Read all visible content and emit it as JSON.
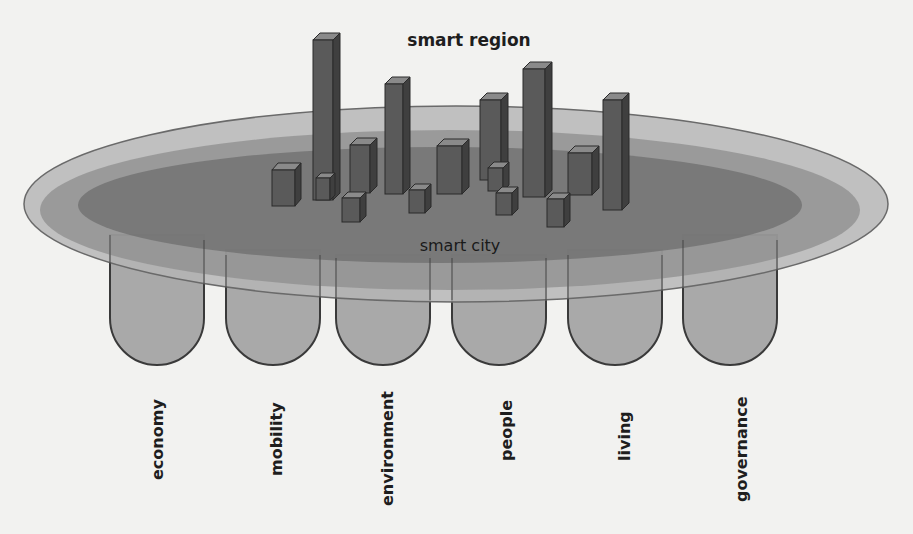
{
  "diagram": {
    "title_top": "smart region",
    "title_center": "smart city",
    "pillars": [
      {
        "label": "economy"
      },
      {
        "label": "mobility"
      },
      {
        "label": "environment"
      },
      {
        "label": "people"
      },
      {
        "label": "living"
      },
      {
        "label": "governance"
      }
    ],
    "layers": [
      {
        "name": "smart region outer ring",
        "color": "#b4b4b4"
      },
      {
        "name": "middle ring",
        "color": "#8f8f8f"
      },
      {
        "name": "smart city core",
        "color": "#6e6e6e"
      }
    ],
    "colors": {
      "pillar_fill": "#a9a9a9",
      "pillar_stroke": "#3a3a3a",
      "bar_front": "#5a5a5a",
      "bar_side": "#3f3f3f",
      "bar_top": "#8a8a8a",
      "background": "#f2f2f0"
    }
  }
}
